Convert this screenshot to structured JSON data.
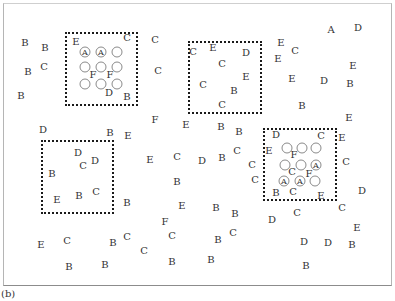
{
  "caption": "(b)",
  "boxes": [
    {
      "x": 65,
      "y": 32,
      "w": 73,
      "h": 74
    },
    {
      "x": 188,
      "y": 41,
      "w": 74,
      "h": 73
    },
    {
      "x": 41,
      "y": 140,
      "w": 73,
      "h": 74
    },
    {
      "x": 263,
      "y": 128,
      "w": 74,
      "h": 73
    }
  ],
  "circles": [
    {
      "x": 85,
      "y": 52,
      "label": "A"
    },
    {
      "x": 101,
      "y": 52,
      "label": "A"
    },
    {
      "x": 117,
      "y": 52,
      "label": ""
    },
    {
      "x": 85,
      "y": 67,
      "label": ""
    },
    {
      "x": 101,
      "y": 67,
      "label": ""
    },
    {
      "x": 117,
      "y": 67,
      "label": ""
    },
    {
      "x": 85,
      "y": 84,
      "label": ""
    },
    {
      "x": 101,
      "y": 84,
      "label": ""
    },
    {
      "x": 117,
      "y": 84,
      "label": ""
    },
    {
      "x": 287,
      "y": 148,
      "label": ""
    },
    {
      "x": 302,
      "y": 148,
      "label": ""
    },
    {
      "x": 316,
      "y": 148,
      "label": ""
    },
    {
      "x": 285,
      "y": 165,
      "label": ""
    },
    {
      "x": 301,
      "y": 165,
      "label": ""
    },
    {
      "x": 316,
      "y": 165,
      "label": "A"
    },
    {
      "x": 284,
      "y": 181,
      "label": "A"
    },
    {
      "x": 300,
      "y": 181,
      "label": "A"
    },
    {
      "x": 315,
      "y": 181,
      "label": ""
    }
  ],
  "letters": [
    {
      "t": "B",
      "x": 25,
      "y": 43
    },
    {
      "t": "B",
      "x": 45,
      "y": 48
    },
    {
      "t": "E",
      "x": 76,
      "y": 42
    },
    {
      "t": "C",
      "x": 127,
      "y": 38
    },
    {
      "t": "C",
      "x": 155,
      "y": 40
    },
    {
      "t": "C",
      "x": 44,
      "y": 67
    },
    {
      "t": "B",
      "x": 28,
      "y": 72
    },
    {
      "t": "F",
      "x": 93,
      "y": 75
    },
    {
      "t": "F",
      "x": 110,
      "y": 75
    },
    {
      "t": "C",
      "x": 158,
      "y": 71
    },
    {
      "t": "B",
      "x": 21,
      "y": 96
    },
    {
      "t": "D",
      "x": 109,
      "y": 93
    },
    {
      "t": "B",
      "x": 127,
      "y": 97
    },
    {
      "t": "C",
      "x": 193,
      "y": 52
    },
    {
      "t": "E",
      "x": 213,
      "y": 48
    },
    {
      "t": "D",
      "x": 246,
      "y": 53
    },
    {
      "t": "C",
      "x": 222,
      "y": 64
    },
    {
      "t": "E",
      "x": 246,
      "y": 77
    },
    {
      "t": "C",
      "x": 203,
      "y": 85
    },
    {
      "t": "B",
      "x": 234,
      "y": 91
    },
    {
      "t": "C",
      "x": 222,
      "y": 105
    },
    {
      "t": "A",
      "x": 331,
      "y": 30
    },
    {
      "t": "D",
      "x": 358,
      "y": 28
    },
    {
      "t": "E",
      "x": 281,
      "y": 43
    },
    {
      "t": "C",
      "x": 295,
      "y": 51
    },
    {
      "t": "E",
      "x": 278,
      "y": 59
    },
    {
      "t": "E",
      "x": 353,
      "y": 66
    },
    {
      "t": "E",
      "x": 292,
      "y": 79
    },
    {
      "t": "D",
      "x": 324,
      "y": 81
    },
    {
      "t": "B",
      "x": 350,
      "y": 84
    },
    {
      "t": "B",
      "x": 302,
      "y": 106
    },
    {
      "t": "F",
      "x": 155,
      "y": 120
    },
    {
      "t": "E",
      "x": 186,
      "y": 125
    },
    {
      "t": "E",
      "x": 349,
      "y": 118
    },
    {
      "t": "B",
      "x": 221,
      "y": 127
    },
    {
      "t": "B",
      "x": 239,
      "y": 132
    },
    {
      "t": "D",
      "x": 43,
      "y": 130
    },
    {
      "t": "B",
      "x": 110,
      "y": 133
    },
    {
      "t": "E",
      "x": 128,
      "y": 136
    },
    {
      "t": "D",
      "x": 78,
      "y": 153
    },
    {
      "t": "D",
      "x": 95,
      "y": 161
    },
    {
      "t": "C",
      "x": 83,
      "y": 166
    },
    {
      "t": "B",
      "x": 52,
      "y": 174
    },
    {
      "t": "E",
      "x": 57,
      "y": 200
    },
    {
      "t": "B",
      "x": 79,
      "y": 196
    },
    {
      "t": "C",
      "x": 96,
      "y": 192
    },
    {
      "t": "E",
      "x": 150,
      "y": 160
    },
    {
      "t": "C",
      "x": 177,
      "y": 157
    },
    {
      "t": "D",
      "x": 202,
      "y": 161
    },
    {
      "t": "B",
      "x": 222,
      "y": 158
    },
    {
      "t": "C",
      "x": 237,
      "y": 151
    },
    {
      "t": "D",
      "x": 276,
      "y": 135
    },
    {
      "t": "C",
      "x": 321,
      "y": 136
    },
    {
      "t": "E",
      "x": 342,
      "y": 138
    },
    {
      "t": "E",
      "x": 269,
      "y": 151
    },
    {
      "t": "F",
      "x": 294,
      "y": 155
    },
    {
      "t": "C",
      "x": 252,
      "y": 165
    },
    {
      "t": "C",
      "x": 255,
      "y": 180
    },
    {
      "t": "C",
      "x": 292,
      "y": 172
    },
    {
      "t": "F",
      "x": 309,
      "y": 174
    },
    {
      "t": "C",
      "x": 346,
      "y": 162
    },
    {
      "t": "B",
      "x": 276,
      "y": 193
    },
    {
      "t": "C",
      "x": 293,
      "y": 192
    },
    {
      "t": "E",
      "x": 321,
      "y": 196
    },
    {
      "t": "D",
      "x": 362,
      "y": 191
    },
    {
      "t": "B",
      "x": 177,
      "y": 182
    },
    {
      "t": "B",
      "x": 127,
      "y": 203
    },
    {
      "t": "E",
      "x": 182,
      "y": 206
    },
    {
      "t": "B",
      "x": 216,
      "y": 208
    },
    {
      "t": "B",
      "x": 235,
      "y": 214
    },
    {
      "t": "D",
      "x": 272,
      "y": 220
    },
    {
      "t": "C",
      "x": 297,
      "y": 213
    },
    {
      "t": "C",
      "x": 342,
      "y": 208
    },
    {
      "t": "E",
      "x": 357,
      "y": 228
    },
    {
      "t": "F",
      "x": 165,
      "y": 222
    },
    {
      "t": "E",
      "x": 41,
      "y": 245
    },
    {
      "t": "C",
      "x": 67,
      "y": 241
    },
    {
      "t": "B",
      "x": 113,
      "y": 243
    },
    {
      "t": "C",
      "x": 127,
      "y": 237
    },
    {
      "t": "C",
      "x": 144,
      "y": 251
    },
    {
      "t": "C",
      "x": 172,
      "y": 236
    },
    {
      "t": "B",
      "x": 218,
      "y": 240
    },
    {
      "t": "C",
      "x": 233,
      "y": 233
    },
    {
      "t": "D",
      "x": 304,
      "y": 242
    },
    {
      "t": "D",
      "x": 328,
      "y": 243
    },
    {
      "t": "B",
      "x": 352,
      "y": 245
    },
    {
      "t": "B",
      "x": 69,
      "y": 267
    },
    {
      "t": "B",
      "x": 105,
      "y": 265
    },
    {
      "t": "B",
      "x": 172,
      "y": 262
    },
    {
      "t": "B",
      "x": 211,
      "y": 260
    },
    {
      "t": "B",
      "x": 306,
      "y": 266
    }
  ]
}
